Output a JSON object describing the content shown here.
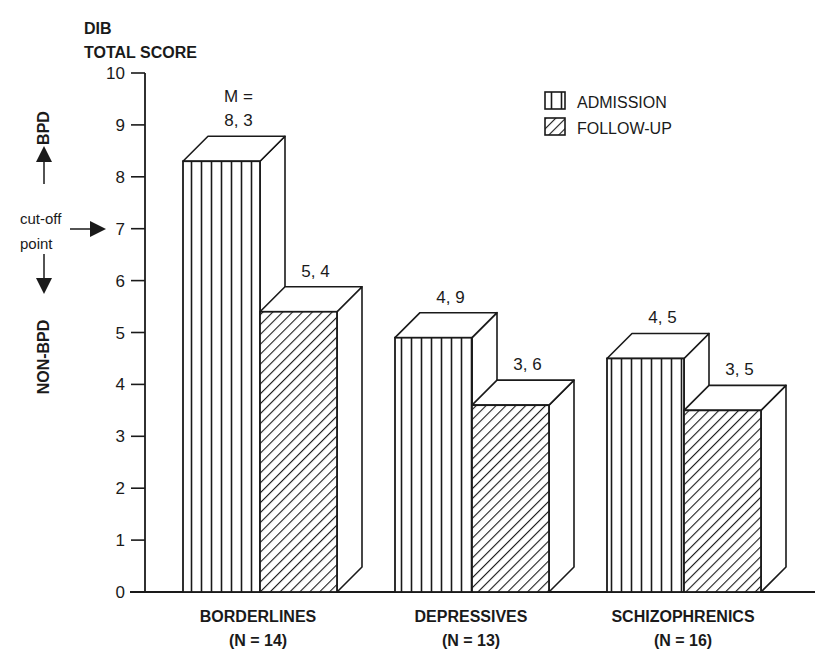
{
  "chart_data": {
    "type": "bar",
    "style": "3d-grouped",
    "title": "",
    "ylabel_lines": [
      "DIB",
      "TOTAL SCORE"
    ],
    "xlabel": "",
    "ylim": [
      0,
      10
    ],
    "yticks": [
      0,
      1,
      2,
      3,
      4,
      5,
      6,
      7,
      8,
      9,
      10
    ],
    "grid": false,
    "categories": [
      {
        "name": "BORDERLINES",
        "n_label": "(N = 14)"
      },
      {
        "name": "DEPRESSIVES",
        "n_label": "(N = 13)"
      },
      {
        "name": "SCHIZOPHRENICS",
        "n_label": "(N = 16)"
      }
    ],
    "series": [
      {
        "name": "ADMISSION",
        "pattern": "vertical-stripes",
        "values": [
          8.3,
          4.9,
          4.5
        ],
        "labels": [
          "8, 3",
          "4, 9",
          "4, 5"
        ]
      },
      {
        "name": "FOLLOW-UP",
        "pattern": "diagonal-hatch",
        "values": [
          5.4,
          3.6,
          3.5
        ],
        "labels": [
          "5, 4",
          "3, 6",
          "3, 5"
        ]
      }
    ],
    "first_label_prefix": "M =",
    "legend": {
      "placement": "top-right",
      "entries": [
        "ADMISSION",
        "FOLLOW-UP"
      ]
    },
    "annotations": {
      "upper_region": "BPD",
      "lower_region": "NON-BPD",
      "cutoff_label_lines": [
        "cut-off",
        "point"
      ],
      "cutoff_value": 7
    }
  },
  "colors": {
    "ink": "#1a1a1a",
    "background": "#ffffff"
  }
}
